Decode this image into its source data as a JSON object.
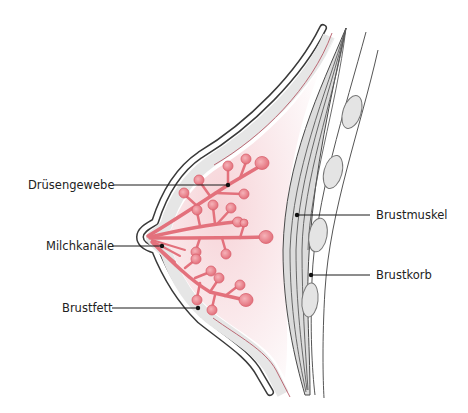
{
  "diagram": {
    "labels": {
      "druesengewebe": "Drüsengewebe",
      "milchkanaele": "Milchkanäle",
      "brustfett": "Brustfett",
      "brustmuskel": "Brustmuskel",
      "brustkorb": "Brustkorb"
    },
    "colors": {
      "outline": "#3a3a3a",
      "skin_fill": "#e6e6e6",
      "inner_fill": "#fbeef0",
      "gland": "#e67f89",
      "gland_light": "#f2a3aa",
      "muscle_fill": "#dcdcdc",
      "rib_fill": "#e4e4e4",
      "leader_line": "#1a1a1a",
      "red_line": "#b55a68"
    }
  }
}
